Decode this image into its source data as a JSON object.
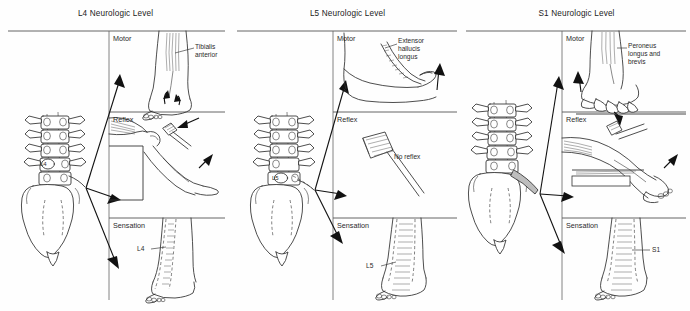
{
  "figure": {
    "caption_present": false,
    "panel_count": 3,
    "section_names": [
      "Motor",
      "Reflex",
      "Sensation"
    ]
  },
  "panels": [
    {
      "title": "L4 Neurologic Level",
      "root_label": "L4",
      "sections": [
        {
          "name": "Motor",
          "annotation": "Tibialis\nanterior"
        },
        {
          "name": "Reflex",
          "annotation": ""
        },
        {
          "name": "Sensation",
          "annotation": "L4"
        }
      ]
    },
    {
      "title": "L5 Neurologic Level",
      "root_label": "L5",
      "sections": [
        {
          "name": "Motor",
          "annotation": "Extensor\nhallucis\nlongus"
        },
        {
          "name": "Reflex",
          "annotation": "No reflex"
        },
        {
          "name": "Sensation",
          "annotation": "L5"
        }
      ]
    },
    {
      "title": "S1 Neurologic Level",
      "root_label": "S1",
      "sections": [
        {
          "name": "Motor",
          "annotation": "Peroneus\nlongus and\nbrevis"
        },
        {
          "name": "Reflex",
          "annotation": ""
        },
        {
          "name": "Sensation",
          "annotation": "S1"
        }
      ]
    }
  ],
  "colors": {
    "background": "#fefefe",
    "ink": "#2e2e2e",
    "rule": "#555555",
    "text": "#222222"
  }
}
